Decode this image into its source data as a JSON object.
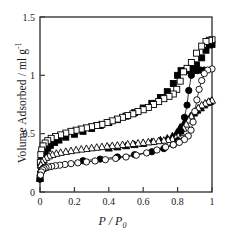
{
  "chart_data": {
    "type": "scatter",
    "title": "",
    "subtitle": "",
    "xlabel": "P / P0",
    "xlabel_parts": {
      "numerator": "P",
      "slash": " / ",
      "denominator": "P",
      "denominator_sub": "0"
    },
    "ylabel": "Volume Adsorbed / ml g-1",
    "ylabel_parts": {
      "text": "Volume Adsorbed / ml g",
      "superscript": "-1"
    },
    "xlim": [
      0,
      1
    ],
    "ylim": [
      0,
      1.5
    ],
    "xticks": [
      0,
      0.2,
      0.4,
      0.6,
      0.8,
      1
    ],
    "xtick_labels": [
      "0",
      "0.2",
      "0.4",
      "0.6",
      "0.8",
      "1"
    ],
    "yticks": [
      0,
      0.5,
      1,
      1.5
    ],
    "ytick_labels": [
      "0",
      "0.5",
      "1",
      "1.5"
    ],
    "grid": false,
    "legend": "none",
    "frame": "box",
    "marker_color": "#000000",
    "background": "#ffffff",
    "series": [
      {
        "name": "Sample A adsorption",
        "marker": "filled-square",
        "filled": true,
        "branch": "adsorption",
        "connected": false,
        "points": [
          [
            0.0,
            0.12
          ],
          [
            0.004,
            0.23
          ],
          [
            0.008,
            0.27
          ],
          [
            0.013,
            0.3
          ],
          [
            0.02,
            0.325
          ],
          [
            0.03,
            0.35
          ],
          [
            0.045,
            0.375
          ],
          [
            0.06,
            0.4
          ],
          [
            0.085,
            0.425
          ],
          [
            0.11,
            0.445
          ],
          [
            0.15,
            0.47
          ],
          [
            0.2,
            0.495
          ],
          [
            0.25,
            0.52
          ],
          [
            0.3,
            0.545
          ],
          [
            0.35,
            0.57
          ],
          [
            0.4,
            0.595
          ],
          [
            0.45,
            0.62
          ],
          [
            0.5,
            0.65
          ],
          [
            0.55,
            0.68
          ],
          [
            0.6,
            0.72
          ],
          [
            0.65,
            0.76
          ],
          [
            0.7,
            0.81
          ],
          [
            0.74,
            0.86
          ],
          [
            0.775,
            0.93
          ],
          [
            0.8,
            1.0
          ],
          [
            0.82,
            1.04
          ],
          [
            0.85,
            1.04
          ],
          [
            0.88,
            1.06
          ],
          [
            0.91,
            1.09
          ],
          [
            0.94,
            1.15
          ],
          [
            0.965,
            1.215
          ],
          [
            0.985,
            1.26
          ],
          [
            1.0,
            1.265
          ]
        ]
      },
      {
        "name": "Sample A desorption",
        "marker": "open-square",
        "filled": false,
        "branch": "desorption",
        "connected": false,
        "points": [
          [
            1.0,
            1.305
          ],
          [
            0.985,
            1.3
          ],
          [
            0.965,
            1.29
          ],
          [
            0.94,
            1.25
          ],
          [
            0.91,
            1.19
          ],
          [
            0.88,
            1.11
          ],
          [
            0.855,
            1.06
          ],
          [
            0.835,
            1.03
          ],
          [
            0.815,
            0.95
          ],
          [
            0.795,
            0.88
          ],
          [
            0.775,
            0.84
          ],
          [
            0.75,
            0.82
          ],
          [
            0.72,
            0.8
          ],
          [
            0.69,
            0.775
          ],
          [
            0.66,
            0.75
          ],
          [
            0.63,
            0.725
          ],
          [
            0.6,
            0.705
          ],
          [
            0.57,
            0.69
          ],
          [
            0.54,
            0.67
          ],
          [
            0.51,
            0.655
          ],
          [
            0.48,
            0.64
          ],
          [
            0.45,
            0.625
          ],
          [
            0.42,
            0.61
          ],
          [
            0.39,
            0.595
          ],
          [
            0.36,
            0.58
          ],
          [
            0.33,
            0.57
          ],
          [
            0.3,
            0.56
          ],
          [
            0.27,
            0.55
          ],
          [
            0.24,
            0.54
          ],
          [
            0.21,
            0.53
          ],
          [
            0.18,
            0.52
          ],
          [
            0.15,
            0.505
          ],
          [
            0.12,
            0.49
          ],
          [
            0.09,
            0.475
          ],
          [
            0.065,
            0.46
          ],
          [
            0.045,
            0.44
          ],
          [
            0.03,
            0.42
          ],
          [
            0.018,
            0.395
          ],
          [
            0.01,
            0.36
          ],
          [
            0.005,
            0.32
          ],
          [
            0.002,
            0.255
          ]
        ]
      },
      {
        "name": "Sample B adsorption",
        "marker": "filled-triangle",
        "filled": true,
        "branch": "adsorption",
        "connected": false,
        "points": [
          [
            0.0,
            0.115
          ],
          [
            0.005,
            0.195
          ],
          [
            0.012,
            0.23
          ],
          [
            0.022,
            0.25
          ],
          [
            0.4,
            0.375
          ],
          [
            0.45,
            0.385
          ],
          [
            0.5,
            0.395
          ],
          [
            0.55,
            0.405
          ],
          [
            0.6,
            0.415
          ],
          [
            0.65,
            0.43
          ],
          [
            0.7,
            0.445
          ],
          [
            0.74,
            0.46
          ],
          [
            0.77,
            0.48
          ],
          [
            0.795,
            0.51
          ],
          [
            0.815,
            0.555
          ],
          [
            0.835,
            0.585
          ],
          [
            0.855,
            0.62
          ],
          [
            0.875,
            0.65
          ],
          [
            0.895,
            0.675
          ],
          [
            0.915,
            0.7
          ],
          [
            0.935,
            0.72
          ],
          [
            0.955,
            0.745
          ],
          [
            0.975,
            0.765
          ],
          [
            0.99,
            0.775
          ]
        ]
      },
      {
        "name": "Sample B desorption",
        "marker": "open-triangle",
        "filled": false,
        "branch": "desorption",
        "connected": false,
        "points": [
          [
            1.0,
            0.785
          ],
          [
            0.98,
            0.775
          ],
          [
            0.96,
            0.76
          ],
          [
            0.94,
            0.745
          ],
          [
            0.92,
            0.72
          ],
          [
            0.9,
            0.69
          ],
          [
            0.88,
            0.65
          ],
          [
            0.865,
            0.615
          ],
          [
            0.85,
            0.58
          ],
          [
            0.835,
            0.545
          ],
          [
            0.82,
            0.51
          ],
          [
            0.805,
            0.48
          ],
          [
            0.79,
            0.465
          ],
          [
            0.77,
            0.455
          ],
          [
            0.745,
            0.448
          ],
          [
            0.72,
            0.442
          ],
          [
            0.69,
            0.438
          ],
          [
            0.66,
            0.432
          ],
          [
            0.63,
            0.428
          ],
          [
            0.6,
            0.423
          ],
          [
            0.57,
            0.418
          ],
          [
            0.54,
            0.414
          ],
          [
            0.51,
            0.41
          ],
          [
            0.48,
            0.405
          ],
          [
            0.45,
            0.4
          ],
          [
            0.42,
            0.396
          ],
          [
            0.39,
            0.392
          ],
          [
            0.36,
            0.387
          ],
          [
            0.33,
            0.382
          ],
          [
            0.3,
            0.377
          ],
          [
            0.27,
            0.371
          ],
          [
            0.24,
            0.366
          ],
          [
            0.21,
            0.36
          ],
          [
            0.18,
            0.353
          ],
          [
            0.15,
            0.346
          ],
          [
            0.12,
            0.338
          ],
          [
            0.095,
            0.33
          ],
          [
            0.072,
            0.32
          ],
          [
            0.052,
            0.308
          ],
          [
            0.036,
            0.295
          ],
          [
            0.022,
            0.278
          ],
          [
            0.012,
            0.258
          ],
          [
            0.005,
            0.232
          ]
        ]
      },
      {
        "name": "Sample C adsorption",
        "marker": "filled-circle",
        "filled": true,
        "branch": "adsorption",
        "connected": true,
        "points": [
          [
            0.0,
            0.11
          ],
          [
            0.004,
            0.165
          ],
          [
            0.01,
            0.19
          ],
          [
            0.02,
            0.205
          ],
          [
            0.25,
            0.268
          ],
          [
            0.35,
            0.282
          ],
          [
            0.45,
            0.3
          ],
          [
            0.55,
            0.32
          ],
          [
            0.65,
            0.345
          ],
          [
            0.72,
            0.372
          ],
          [
            0.775,
            0.405
          ],
          [
            0.8,
            0.44
          ],
          [
            0.82,
            0.52
          ],
          [
            0.84,
            0.64
          ],
          [
            0.855,
            0.745
          ],
          [
            0.865,
            0.87
          ],
          [
            0.88,
            1.0
          ],
          [
            0.895,
            1.04
          ],
          [
            0.915,
            1.04
          ],
          [
            0.935,
            1.045
          ],
          [
            0.955,
            1.045
          ]
        ]
      },
      {
        "name": "Sample C desorption",
        "marker": "open-circle",
        "filled": false,
        "branch": "desorption",
        "connected": true,
        "points": [
          [
            1.0,
            1.055
          ],
          [
            0.975,
            1.045
          ],
          [
            0.955,
            1.015
          ],
          [
            0.94,
            0.955
          ],
          [
            0.925,
            0.88
          ],
          [
            0.912,
            0.79
          ],
          [
            0.9,
            0.69
          ],
          [
            0.89,
            0.6
          ],
          [
            0.878,
            0.53
          ],
          [
            0.862,
            0.48
          ],
          [
            0.84,
            0.45
          ],
          [
            0.81,
            0.425
          ],
          [
            0.775,
            0.405
          ],
          [
            0.73,
            0.385
          ],
          [
            0.68,
            0.36
          ],
          [
            0.62,
            0.335
          ],
          [
            0.56,
            0.315
          ],
          [
            0.5,
            0.3
          ],
          [
            0.44,
            0.288
          ],
          [
            0.38,
            0.277
          ],
          [
            0.32,
            0.266
          ],
          [
            0.27,
            0.258
          ],
          [
            0.22,
            0.25
          ],
          [
            0.18,
            0.243
          ],
          [
            0.145,
            0.236
          ],
          [
            0.115,
            0.23
          ],
          [
            0.09,
            0.225
          ],
          [
            0.068,
            0.22
          ],
          [
            0.05,
            0.214
          ],
          [
            0.035,
            0.208
          ],
          [
            0.024,
            0.2
          ],
          [
            0.015,
            0.19
          ],
          [
            0.008,
            0.172
          ],
          [
            0.003,
            0.145
          ]
        ]
      }
    ]
  }
}
